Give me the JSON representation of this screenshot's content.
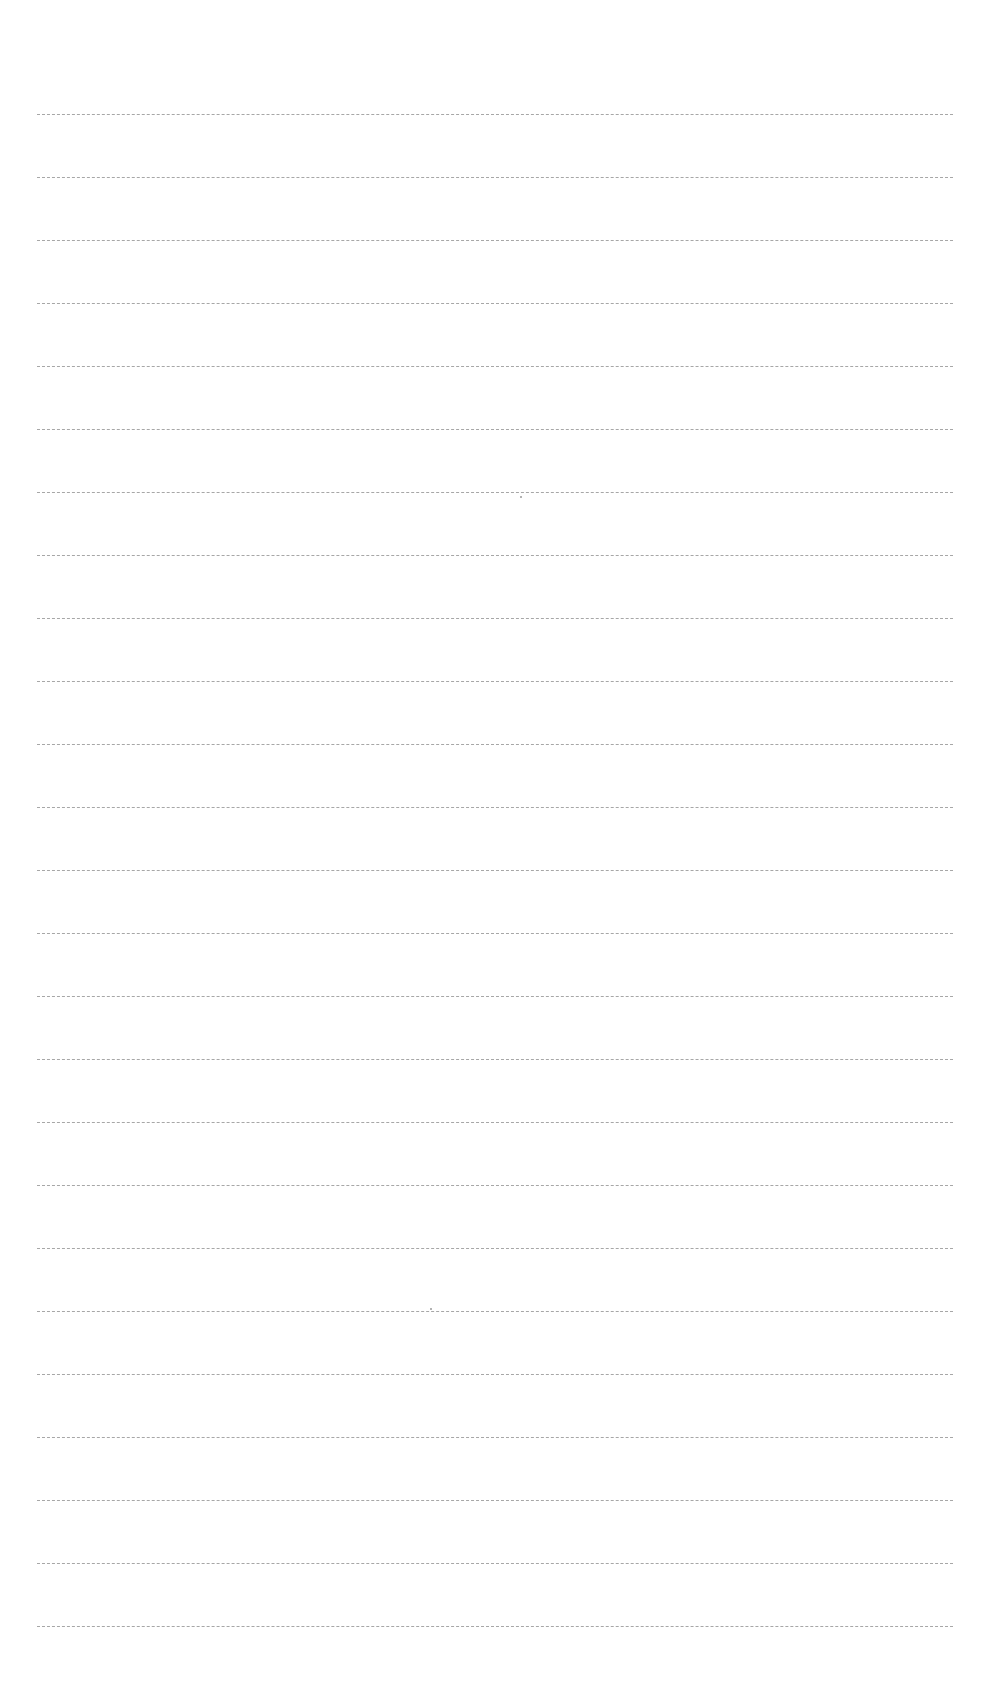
{
  "page": {
    "type": "blank ruled paper",
    "background": "#ffffff",
    "line_color": "#8a8a8a",
    "line_count": 25,
    "first_line_y": 114,
    "line_spacing": 63,
    "line_left": 37,
    "line_right": 953
  },
  "text": []
}
